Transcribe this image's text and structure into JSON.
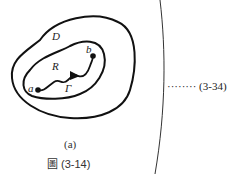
{
  "diagram": {
    "labels": {
      "outer_region": "D",
      "inner_region": "R",
      "point_start": "a",
      "point_end": "b",
      "curve": "Γ"
    },
    "subcaption": "(a)",
    "figure_caption": "圖 (3-14)",
    "equation_ref": "········ (3-34)"
  }
}
